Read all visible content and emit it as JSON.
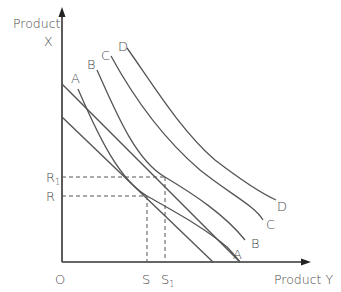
{
  "diagram": {
    "title": "",
    "type": "indifference-curves-budget-lines",
    "colors": {
      "line": "#555555",
      "text": "#4a4a4a",
      "background": "#ffffff"
    },
    "axes": {
      "y_label_line1": "Product",
      "y_label_line2": "X",
      "x_label": "Product Y",
      "origin_label": "O"
    },
    "ticks": {
      "y": [
        {
          "label": "R",
          "sub": "1"
        },
        {
          "label": "R",
          "sub": ""
        }
      ],
      "x": [
        {
          "label": "S",
          "sub": ""
        },
        {
          "label": "S",
          "sub": "1"
        }
      ]
    },
    "indifference_curves": [
      {
        "name": "A",
        "top_label": "A",
        "bottom_label": "A"
      },
      {
        "name": "B",
        "top_label": "B",
        "bottom_label": "B"
      },
      {
        "name": "C",
        "top_label": "C",
        "bottom_label": "C"
      },
      {
        "name": "D",
        "top_label": "D",
        "bottom_label": "D"
      }
    ],
    "budget_lines": [
      {
        "name": "budget-line-upper"
      },
      {
        "name": "budget-line-lower"
      }
    ]
  }
}
